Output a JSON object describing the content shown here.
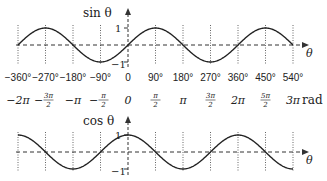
{
  "chart_data": [
    {
      "type": "line",
      "title": "sin θ",
      "ylabel": "sin θ",
      "xlabel": "θ",
      "x_degrees": [
        -360,
        -270,
        -180,
        -90,
        0,
        90,
        180,
        270,
        360,
        450,
        540
      ],
      "values": [
        0,
        1,
        0,
        -1,
        0,
        1,
        0,
        -1,
        0,
        1,
        0
      ],
      "ylim": [
        -1,
        1
      ],
      "y_ticks": [
        "1",
        "-1"
      ],
      "grid": "vertical dotted lines at every 90°"
    },
    {
      "type": "line",
      "title": "cos θ",
      "ylabel": "cos θ",
      "xlabel": "θ",
      "x_degrees": [
        -360,
        -270,
        -180,
        -90,
        0,
        90,
        180,
        270,
        360,
        450,
        540
      ],
      "values": [
        1,
        0,
        -1,
        0,
        1,
        0,
        -1,
        0,
        1,
        0,
        -1
      ],
      "ylim": [
        -1,
        1
      ],
      "y_ticks": [
        "1",
        "-1"
      ],
      "grid": "vertical dotted lines at every 90°"
    }
  ],
  "axis": {
    "degree_labels": [
      "-360°",
      "-270°",
      "-180°",
      "-90°",
      "0",
      "90°",
      "180°",
      "270°",
      "360°",
      "450°",
      "540°"
    ],
    "radian_labels": [
      {
        "text": "-2π"
      },
      {
        "num": "3π",
        "den": "2",
        "sign": "-"
      },
      {
        "text": "-π"
      },
      {
        "num": "π",
        "den": "2",
        "sign": "-"
      },
      {
        "text": "0"
      },
      {
        "num": "π",
        "den": "2",
        "sign": ""
      },
      {
        "text": "π"
      },
      {
        "num": "3π",
        "den": "2",
        "sign": ""
      },
      {
        "text": "2π"
      },
      {
        "num": "5π",
        "den": "2",
        "sign": ""
      },
      {
        "text": "3π"
      }
    ],
    "radian_unit": "rad"
  },
  "sin_plot": {
    "label": "sin θ",
    "theta": "θ",
    "tick_pos": "1",
    "tick_neg": "−1"
  },
  "cos_plot": {
    "label": "cos θ",
    "theta": "θ",
    "tick_pos": "1",
    "tick_neg": "−1"
  },
  "colors": {
    "curve": "#222222",
    "axis": "#333333",
    "grid": "#666666"
  }
}
